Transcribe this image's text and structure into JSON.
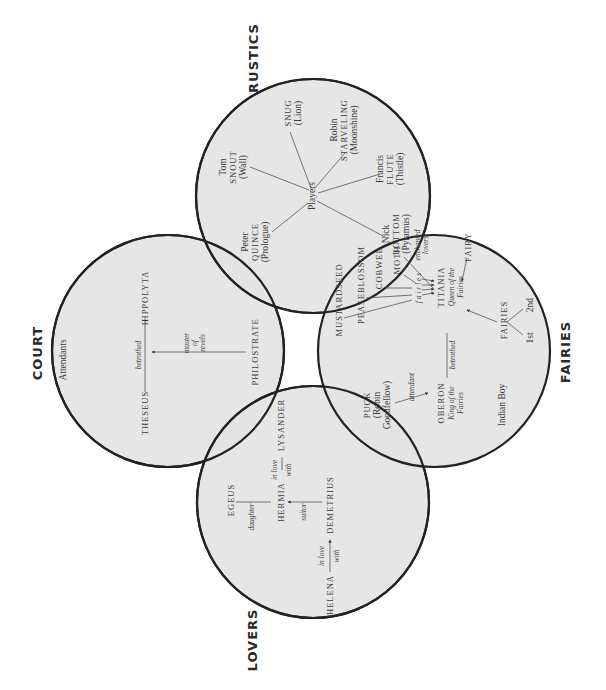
{
  "groups": {
    "court": {
      "label": "COURT",
      "attendants": "Attendants",
      "theseus": "THESEUS",
      "hippolyta": "HIPPOLYTA",
      "betrothed": "betrothed",
      "philostrate": "PHILOSTRATE",
      "master_of_revels": [
        "master",
        "of",
        "revels"
      ]
    },
    "rustics": {
      "label": "RUSTICS",
      "players": "Players",
      "snout": [
        "Tom",
        "SNOUT",
        "(Wall)"
      ],
      "snug": [
        "SNUG",
        "(Lion)"
      ],
      "starveling": [
        "Robin",
        "STARVELING",
        "(Moonshine)"
      ],
      "flute": [
        "Francis",
        "FLUTE",
        "(Thistle)"
      ],
      "quince": [
        "Peter",
        "QUINCE",
        "(Prologue)"
      ],
      "bottom": [
        "Nick",
        "BOTTOM",
        "(Pyramus)"
      ]
    },
    "fairies": {
      "label": "FAIRIES",
      "mustardseed": "MUSTARDSEED",
      "peaseblossom": "PEASEBLOSSOM",
      "cobweb": "COBWEB",
      "moth": "MOTH",
      "fairies_caption": "f a i r i e s",
      "enchanted_lovers": [
        "enchanted",
        "lovers"
      ],
      "titania": "TITANIA",
      "titania_title": [
        "Queen of the",
        "Fairies"
      ],
      "fairy": "FAIRY",
      "fairies_node": "FAIRIES",
      "first": "1st",
      "second": "2nd",
      "betrothed": "betrothed",
      "oberon": "OBERON",
      "oberon_title": [
        "King of the",
        "Fairies"
      ],
      "puck": [
        "PUCK",
        "(Robin",
        "Goodfellow)"
      ],
      "attendant": "attendant",
      "indian_boy": "Indian Boy"
    },
    "lovers": {
      "label": "LOVERS",
      "egeus": "EGEUS",
      "daughter": "daughter",
      "hermia": "HERMIA",
      "in_love_with_1": [
        "in love",
        "with"
      ],
      "lysander": "LYSANDER",
      "suitor": "suitor",
      "demetrius": "DEMETRIUS",
      "helena": "HELENA",
      "in_love_with_2": [
        "in love",
        "with"
      ]
    }
  },
  "colors": {
    "circle_fill": "#e4e4e4",
    "circle_stroke": "#222222",
    "text": "#3a3a3a"
  }
}
